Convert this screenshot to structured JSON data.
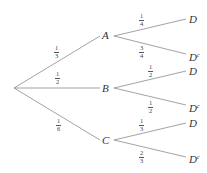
{
  "diagram": {
    "type": "probability-tree",
    "root": "",
    "first_level": [
      {
        "label": "A",
        "prob_num": "1",
        "prob_den": "3",
        "branches": [
          {
            "label": "D",
            "prob_num": "1",
            "prob_den": "4"
          },
          {
            "label": "D",
            "sup": "c",
            "prob_num": "3",
            "prob_den": "4"
          }
        ]
      },
      {
        "label": "B",
        "prob_num": "1",
        "prob_den": "2",
        "branches": [
          {
            "label": "D",
            "prob_num": "1",
            "prob_den": "2"
          },
          {
            "label": "D",
            "sup": "c",
            "prob_num": "1",
            "prob_den": "2"
          }
        ]
      },
      {
        "label": "C",
        "prob_num": "1",
        "prob_den": "6",
        "branches": [
          {
            "label": "D",
            "prob_num": "1",
            "prob_den": "3"
          },
          {
            "label": "D",
            "sup": "c",
            "prob_num": "2",
            "prob_den": "3"
          }
        ]
      }
    ]
  },
  "colors": {
    "line": "#8a8a8a",
    "text": "#333333",
    "background": "#ffffff"
  }
}
